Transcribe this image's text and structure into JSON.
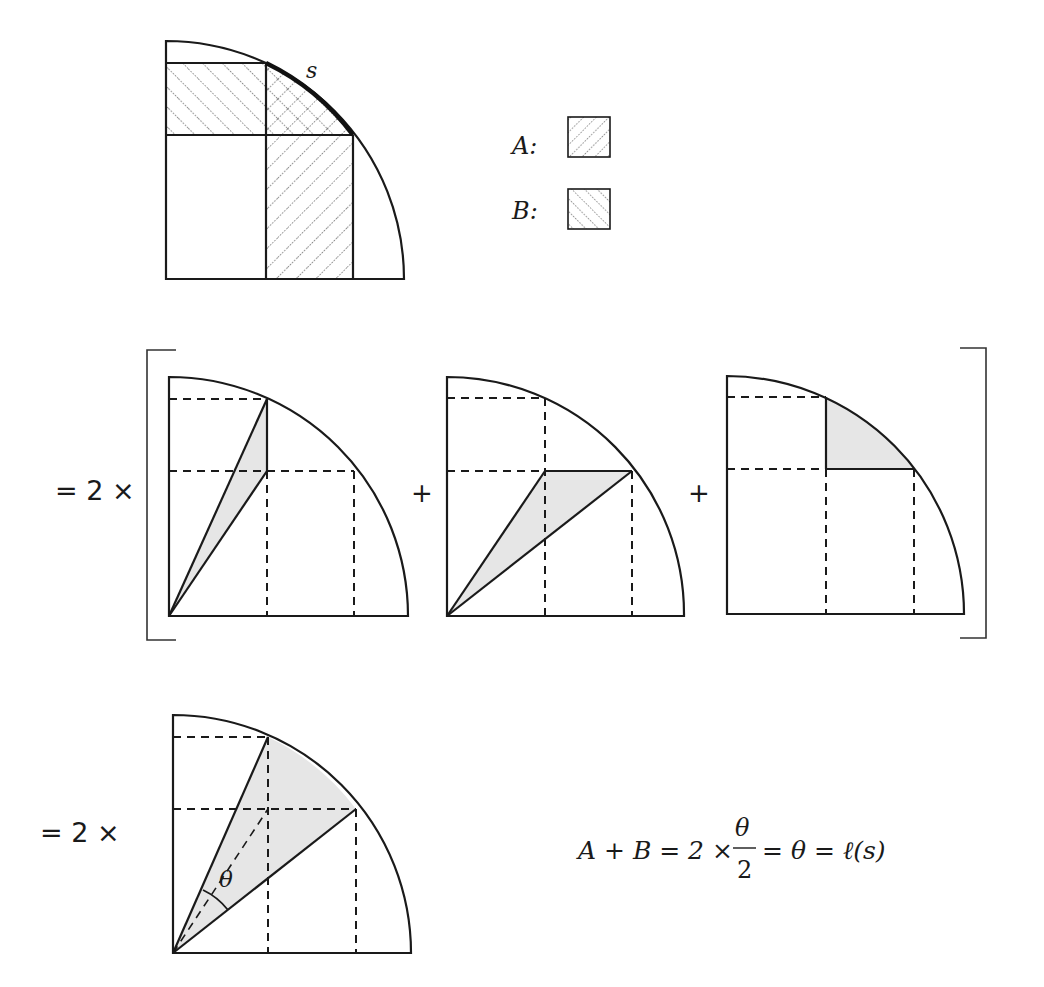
{
  "figure": {
    "top": {
      "arc_label": "s",
      "legend": [
        {
          "label": "A:",
          "pattern": "hatch-down-right"
        },
        {
          "label": "B:",
          "pattern": "hatch-up-right"
        }
      ]
    },
    "row2": {
      "prefix": "= 2 ×",
      "plus_1": "+",
      "plus_2": "+",
      "panels": [
        {
          "name": "thin-triangle",
          "shaded": "triangle from origin to arc point and grid intersection"
        },
        {
          "name": "wide-triangle",
          "shaded": "triangle from origin to grid intersection and arc point"
        },
        {
          "name": "curved-corner",
          "shaded": "region between grid corner and arc"
        }
      ]
    },
    "row3": {
      "prefix": "= 2 ×",
      "angle_label": "θ",
      "equation": {
        "lhs": "A + B = 2 ×",
        "frac_num": "θ",
        "frac_den": "2",
        "rhs": "= θ = ℓ(s)"
      }
    }
  },
  "colors": {
    "stroke": "#1a1a1a",
    "shade": "#e6e6e6",
    "background": "#ffffff"
  }
}
